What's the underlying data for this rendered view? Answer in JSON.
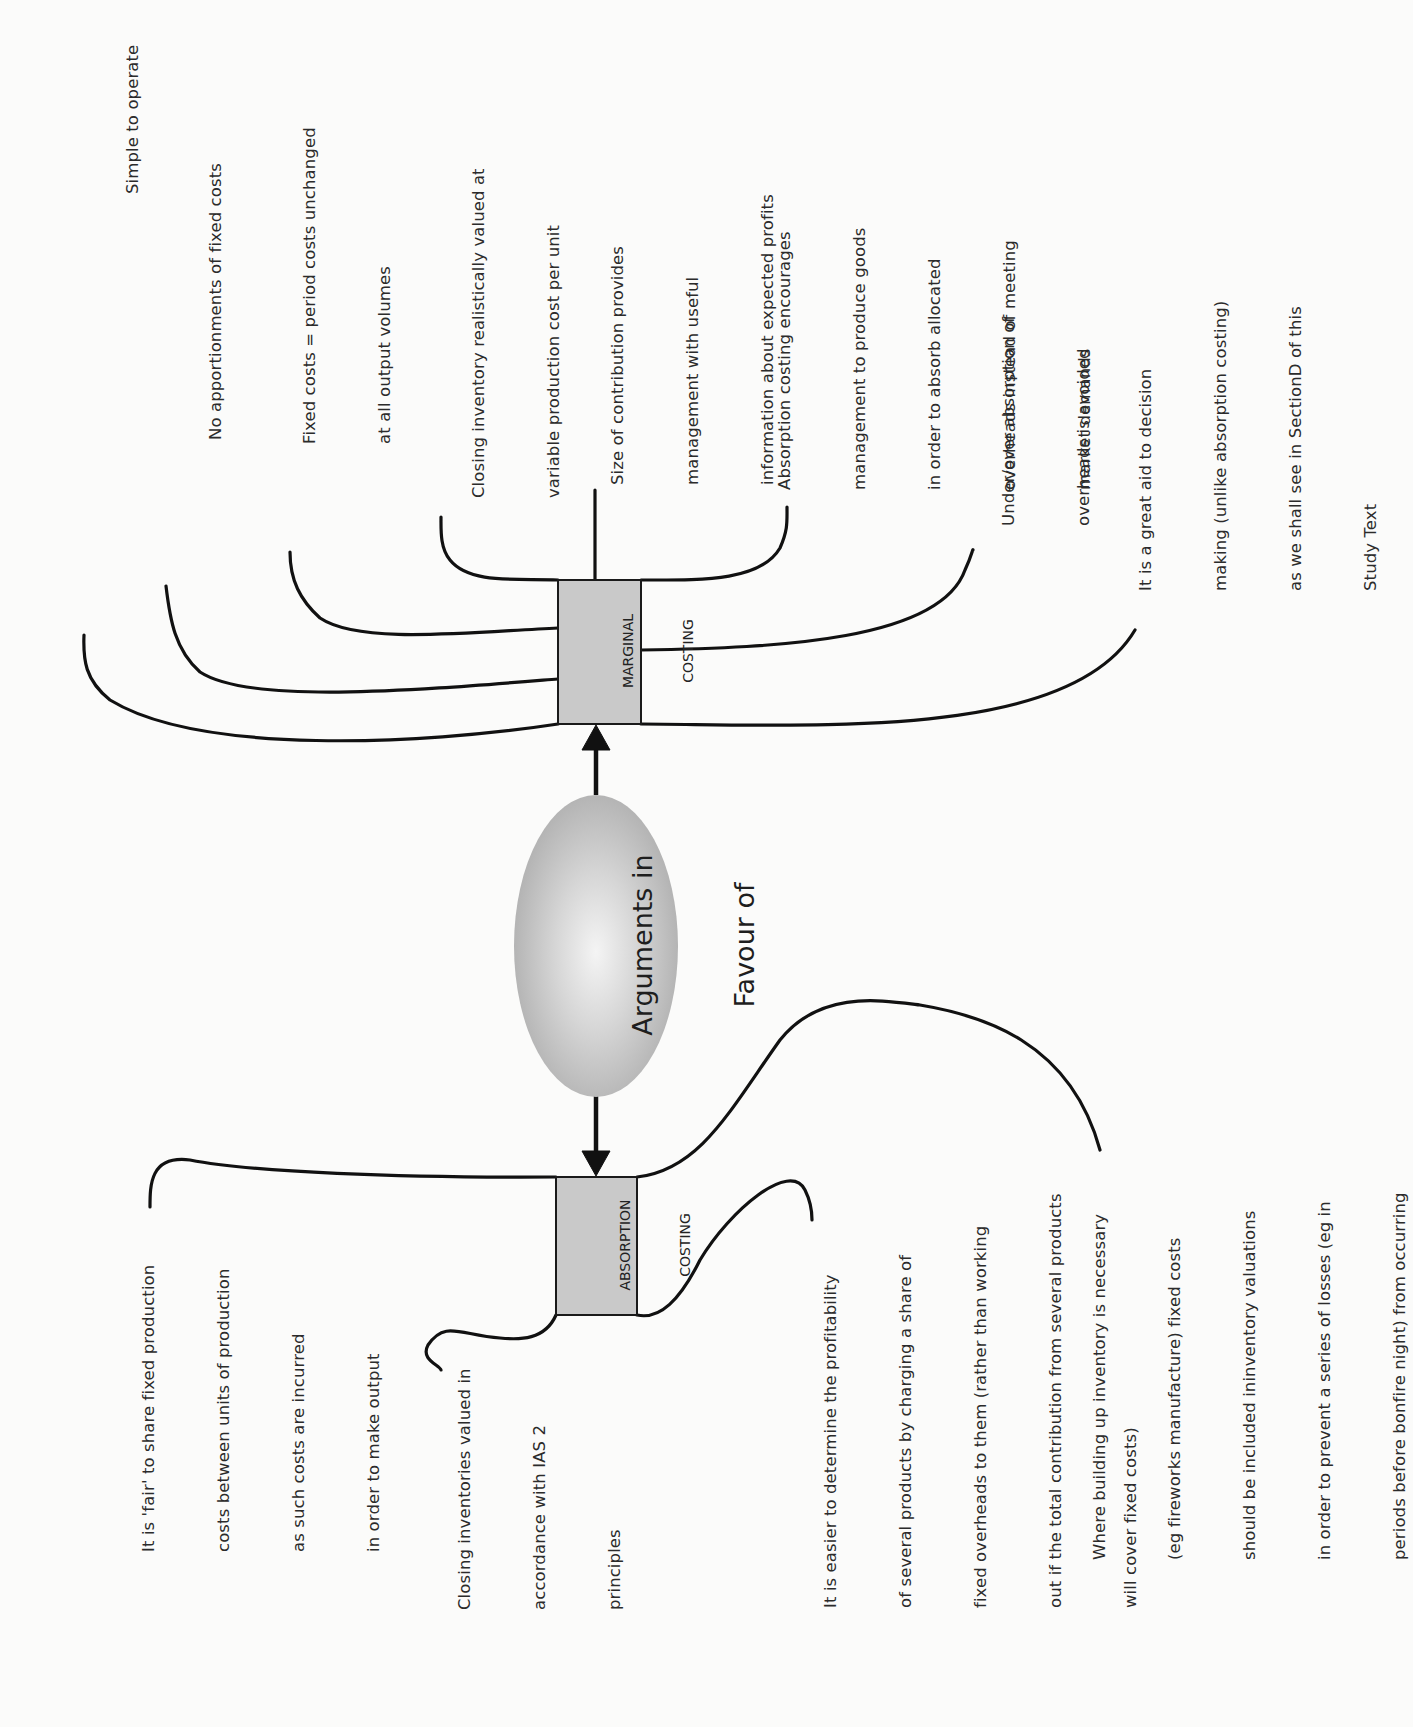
{
  "diagram": {
    "center": {
      "label_line1": "Arguments in",
      "label_line2": "Favour of"
    },
    "marginal": {
      "box_line1": "MARGINAL",
      "box_line2": "COSTING",
      "arguments": [
        {
          "lines": [
            "Simple to operate"
          ]
        },
        {
          "lines": [
            "No apportionments of fixed costs"
          ]
        },
        {
          "lines": [
            "Fixed costs = period costs unchanged",
            "at all output volumes"
          ]
        },
        {
          "lines": [
            "Closing inventory realistically valued at",
            "variable production cost per unit"
          ]
        },
        {
          "lines": [
            "Size of contribution provides",
            "management with useful",
            "information about expected profits"
          ]
        },
        {
          "lines": [
            "Absorption costing encourages",
            "management to produce goods",
            "in order to absorb allocated",
            "overheads instead of meeting",
            "market demands"
          ]
        },
        {
          "lines": [
            "Under/over absorption of",
            "overheads is avoided"
          ]
        },
        {
          "lines": [
            "It is a great aid to decision",
            "making (unlike absorption costing)",
            "as we shall see in SectionD of this",
            "Study Text"
          ]
        }
      ]
    },
    "absorption": {
      "box_line1": "ABSORPTION",
      "box_line2": "COSTING",
      "arguments": [
        {
          "lines": [
            "It is 'fair' to share fixed production",
            "costs between units of production",
            "as such costs are incurred",
            "in order to make output"
          ]
        },
        {
          "lines": [
            "Closing inventories valued in",
            "accordance with IAS 2",
            "principles"
          ]
        },
        {
          "lines": [
            "It is easier to determine the profitability",
            "of several products by charging a share of",
            "fixed overheads to them (rather than working",
            "out if the total contribution from several products",
            "will cover fixed costs)"
          ]
        },
        {
          "lines": [
            "Where building up inventory is necessary",
            "(eg fireworks manufacture) fixed costs",
            "should be included ininventory valuations",
            "in order to prevent a series of losses (eg in",
            "periods before bonfire night) from occurring"
          ]
        }
      ]
    },
    "colors": {
      "box_fill": "#c9c9c9",
      "line": "#111111",
      "ellipse_fill": "#b5b5b5",
      "page": "#fbfbfa"
    }
  }
}
